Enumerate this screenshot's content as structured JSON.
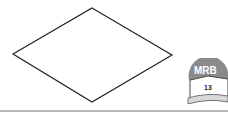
{
  "figure": {
    "shape": "rhombus",
    "vertices": {
      "top": [
        92,
        8
      ],
      "right": [
        172,
        55
      ],
      "bottom": [
        92,
        102
      ],
      "left": [
        13,
        54
      ]
    },
    "stroke_color": "#222222"
  },
  "logo": {
    "text": "MRB",
    "number": "13",
    "icon": "open-book-icon"
  },
  "colors": {
    "rule": "#b8b8b8",
    "logo_arc": "#8a8a8a"
  }
}
